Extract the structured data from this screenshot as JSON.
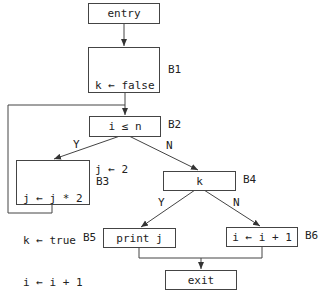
{
  "diagram": {
    "type": "control-flow-graph",
    "nodes": {
      "entry": {
        "text": "entry"
      },
      "B1": {
        "label": "B1",
        "lines": [
          "k ← false",
          "i ← 1",
          "j ← 2"
        ]
      },
      "B2": {
        "label": "B2",
        "text": "i ≤ n"
      },
      "B3": {
        "label": "B3",
        "lines": [
          "j ← j * 2",
          "k ← true",
          "i ← i + 1"
        ]
      },
      "B4": {
        "label": "B4",
        "text": "k"
      },
      "B5": {
        "label": "B5",
        "text": "print j"
      },
      "B6": {
        "label": "B6",
        "text": "i ← i + 1"
      },
      "exit": {
        "text": "exit"
      }
    },
    "edge_labels": {
      "b2_yes": "Y",
      "b2_no": "N",
      "b4_yes": "Y",
      "b4_no": "N"
    },
    "edges": [
      [
        "entry",
        "B1"
      ],
      [
        "B1",
        "B2"
      ],
      [
        "B2",
        "B3",
        "Y"
      ],
      [
        "B2",
        "B4",
        "N"
      ],
      [
        "B3",
        "B2"
      ],
      [
        "B4",
        "B5",
        "Y"
      ],
      [
        "B4",
        "B6",
        "N"
      ],
      [
        "B5",
        "exit"
      ],
      [
        "B6",
        "exit"
      ]
    ]
  }
}
